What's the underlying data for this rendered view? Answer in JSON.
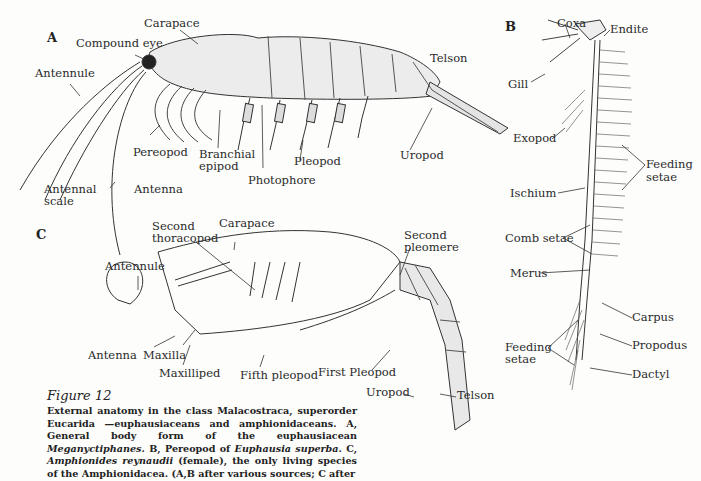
{
  "figure": {
    "number_label": "Figure 12",
    "caption_parts": [
      {
        "t": "External anatomy in the class Malacostraca, superorder Eucarida —euphausiaceans and amphionidaceans. A, General body form of the euphausiacean ",
        "i": false
      },
      {
        "t": "Meganyctiphanes",
        "i": true
      },
      {
        "t": ". B, Pereopod of ",
        "i": false
      },
      {
        "t": "Euphausia superba",
        "i": true
      },
      {
        "t": ". C, ",
        "i": false
      },
      {
        "t": "Amphionides reynaudii",
        "i": true
      },
      {
        "t": " (female), the only living species of the Amphionidacea. (A,B after various sources; C after",
        "i": false
      }
    ]
  },
  "panels": {
    "A": {
      "letter": "A",
      "labels": {
        "carapace": "Carapace",
        "compound_eye": "Compound eye",
        "antennule": "Antennule",
        "pereopod": "Pereopod",
        "branchial_epipod_1": "Branchial",
        "branchial_epipod_2": "epipod",
        "photophore": "Photophore",
        "pleopod": "Pleopod",
        "uropod": "Uropod",
        "telson": "Telson",
        "antennal_scale_1": "Antennal",
        "antennal_scale_2": "scale",
        "antenna": "Antenna"
      }
    },
    "B": {
      "letter": "B",
      "labels": {
        "coxa": "Coxa",
        "endite": "Endite",
        "gill": "Gill",
        "exopod": "Exopod",
        "feeding_setae_top_1": "Feeding",
        "feeding_setae_top_2": "setae",
        "ischium": "Ischium",
        "comb_setae": "Comb setae",
        "merus": "Merus",
        "carpus": "Carpus",
        "feeding_setae_bottom_1": "Feeding",
        "feeding_setae_bottom_2": "setae",
        "propodus": "Propodus",
        "dactyl": "Dactyl"
      }
    },
    "C": {
      "letter": "C",
      "labels": {
        "carapace": "Carapace",
        "second_thoracopod_1": "Second",
        "second_thoracopod_2": "thoracopod",
        "second_pleomere_1": "Second",
        "second_pleomere_2": "pleomere",
        "antennule": "Antennule",
        "antenna": "Antenna",
        "maxilla": "Maxilla",
        "maxilliped": "Maxilliped",
        "fifth_pleopod": "Fifth pleopod",
        "first_pleopod": "First Pleopod",
        "uropod": "Uropod",
        "telson": "Telson"
      }
    }
  }
}
